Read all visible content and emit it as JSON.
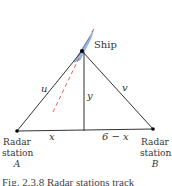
{
  "diagram": {
    "ship_label": "Ship",
    "side_labels": {
      "u": "u",
      "v": "v",
      "y": "y",
      "x": "x",
      "six_minus_x": "6 − x"
    },
    "station_a": {
      "line1": "Radar",
      "line2": "station",
      "line3": "A"
    },
    "station_b": {
      "line1": "Radar",
      "line2": "station",
      "line3": "B"
    },
    "caption": "Fig. 2.3.8  Radar stations track",
    "colors": {
      "lines": "#333333",
      "dashed_track": "#d9534f",
      "ship": "#8fb3e0",
      "points": "#000000"
    },
    "points": {
      "A": [
        17,
        131
      ],
      "B": [
        153,
        129
      ],
      "ship": [
        82,
        51
      ],
      "foot": [
        84,
        131
      ]
    }
  }
}
